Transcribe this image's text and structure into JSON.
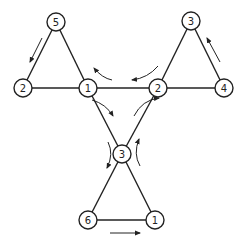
{
  "diagram": {
    "type": "graph",
    "colors": {
      "stroke": "#222222",
      "fill": "#ffffff",
      "background": "#ffffff"
    },
    "nodes": [
      {
        "id": "n5",
        "label": "5",
        "x": 56,
        "y": 22
      },
      {
        "id": "n2a",
        "label": "2",
        "x": 23,
        "y": 88
      },
      {
        "id": "n1a",
        "label": "1",
        "x": 88,
        "y": 88
      },
      {
        "id": "n2b",
        "label": "2",
        "x": 158,
        "y": 88
      },
      {
        "id": "n3a",
        "label": "3",
        "x": 191,
        "y": 21
      },
      {
        "id": "n4",
        "label": "4",
        "x": 224,
        "y": 88
      },
      {
        "id": "n3b",
        "label": "3",
        "x": 122,
        "y": 154
      },
      {
        "id": "n6",
        "label": "6",
        "x": 88,
        "y": 220
      },
      {
        "id": "n1b",
        "label": "1",
        "x": 155,
        "y": 220
      }
    ],
    "edges": [
      [
        "n5",
        "n2a"
      ],
      [
        "n5",
        "n1a"
      ],
      [
        "n2a",
        "n1a"
      ],
      [
        "n1a",
        "n2b"
      ],
      [
        "n1a",
        "n3b"
      ],
      [
        "n2b",
        "n3b"
      ],
      [
        "n3a",
        "n2b"
      ],
      [
        "n3a",
        "n4"
      ],
      [
        "n2b",
        "n4"
      ],
      [
        "n3b",
        "n6"
      ],
      [
        "n3b",
        "n1b"
      ],
      [
        "n6",
        "n1b"
      ]
    ],
    "arrows": [
      {
        "id": "arrow-left-tri",
        "direction": "down-left along 5→2"
      },
      {
        "id": "arrow-right-tri",
        "direction": "up-left along 4→3"
      },
      {
        "id": "arrow-bottom-tri",
        "direction": "right along 6→1"
      },
      {
        "id": "arrow-center-top-left",
        "direction": "curved toward node 1 (leftward)"
      },
      {
        "id": "arrow-center-top-right",
        "direction": "curved leftward above edge 1–2"
      },
      {
        "id": "arrow-center-left",
        "direction": "curved down-right from node 1"
      },
      {
        "id": "arrow-center-right",
        "direction": "curved up-right toward node 2"
      },
      {
        "id": "arrow-center-bottom-left",
        "direction": "curved downward near node 3"
      },
      {
        "id": "arrow-center-bottom-right",
        "direction": "curved upward near node 3"
      }
    ]
  }
}
